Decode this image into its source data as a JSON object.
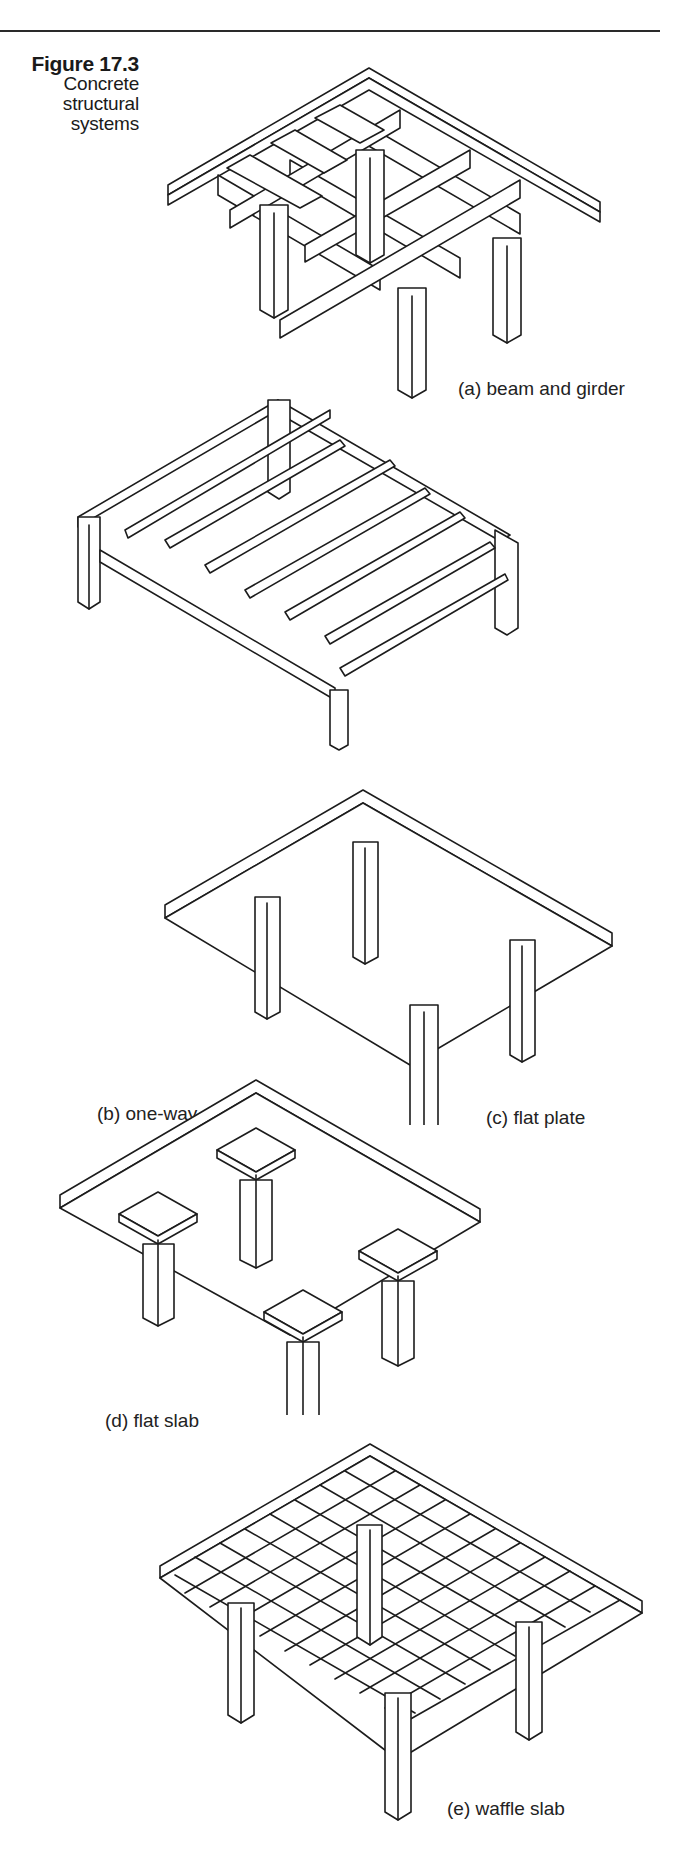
{
  "figure": {
    "number": "Figure 17.3",
    "title_lines": [
      "Concrete",
      "structural",
      "systems"
    ]
  },
  "panels": [
    {
      "id": "a",
      "label": "(a) beam and girder",
      "system": "beam-and-girder"
    },
    {
      "id": "b",
      "label": "(b) one-way pan joists",
      "system": "one-way-pan-joists"
    },
    {
      "id": "c",
      "label": "(c) flat plate",
      "system": "flat-plate"
    },
    {
      "id": "d",
      "label": "(d) flat slab",
      "system": "flat-slab"
    },
    {
      "id": "e",
      "label": "(e) waffle slab",
      "system": "waffle-slab"
    }
  ],
  "colors": {
    "line": "#1c1c1c",
    "background": "#ffffff",
    "rule": "#2a2a2a"
  }
}
